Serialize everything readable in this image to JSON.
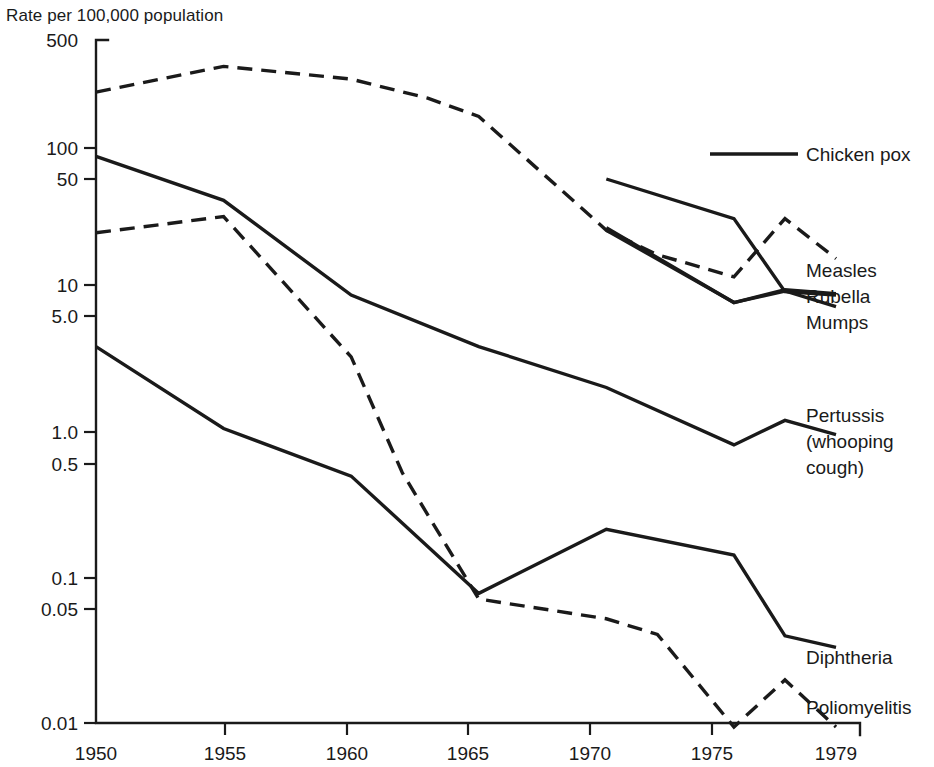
{
  "chart_data": {
    "type": "line",
    "title": "Rate per 100,000 population",
    "xlabel": "",
    "ylabel": "Rate per 100,000 population",
    "scale": "log",
    "grid": false,
    "legend_position": "right-inline-labels",
    "x": [
      1950,
      1955,
      1960,
      1965,
      1970,
      1975,
      1977,
      1979
    ],
    "xticks": [
      "1950",
      "1955",
      "1960",
      "1965",
      "1970",
      "1975",
      "1979"
    ],
    "xtick_values": [
      1950,
      1955,
      1960,
      1965,
      1970,
      1975,
      1979
    ],
    "yticks": [
      "500",
      "100",
      "50",
      "10",
      "5.0",
      "1.0",
      "0.5",
      "0.1",
      "0.05",
      "0.01"
    ],
    "ytick_values": [
      500,
      100,
      50,
      10,
      5.0,
      1.0,
      0.5,
      0.1,
      0.05,
      0.01
    ],
    "ylim": [
      0.01,
      500
    ],
    "xlim": [
      1950,
      1979
    ],
    "series": [
      {
        "name": "Measles",
        "label": "Measles",
        "style": "dashed",
        "x": [
          1950,
          1955,
          1960,
          1963,
          1965,
          1970,
          1972,
          1975,
          1977,
          1979
        ],
        "values": [
          220,
          330,
          270,
          200,
          150,
          25,
          17,
          12,
          30,
          16
        ]
      },
      {
        "name": "Chicken pox",
        "label": "Chicken pox",
        "style": "solid",
        "x": [
          1970,
          1975,
          1977,
          1979
        ],
        "values": [
          56,
          30,
          9.5,
          9.0
        ]
      },
      {
        "name": "Rubella",
        "label": "Rubella",
        "style": "solid",
        "x": [
          1970,
          1975,
          1977,
          1979
        ],
        "values": [
          26,
          8.0,
          9.8,
          9.2
        ]
      },
      {
        "name": "Mumps",
        "label": "Mumps",
        "style": "solid",
        "x": [
          1970,
          1975,
          1977,
          1979
        ],
        "values": [
          25,
          8.0,
          9.6,
          7.5
        ]
      },
      {
        "name": "Pertussis (whooping cough)",
        "label": "Pertussis\n(whooping\ncough)",
        "label_lines": [
          "Pertussis",
          "(whooping",
          "cough)"
        ],
        "style": "solid",
        "x": [
          1950,
          1955,
          1960,
          1965,
          1970,
          1975,
          1977,
          1979
        ],
        "values": [
          80,
          40,
          9.0,
          4.0,
          2.1,
          0.85,
          1.25,
          1.0
        ]
      },
      {
        "name": "Poliomyelitis",
        "label": "Poliomyelitis",
        "style": "dashed",
        "x": [
          1950,
          1955,
          1960,
          1962,
          1965,
          1970,
          1972,
          1975,
          1977,
          1979
        ],
        "values": [
          24,
          31,
          3.4,
          0.55,
          0.075,
          0.055,
          0.043,
          0.01,
          0.021,
          0.01
        ]
      },
      {
        "name": "Diphtheria",
        "label": "Diphtheria",
        "style": "solid",
        "x": [
          1950,
          1955,
          1960,
          1965,
          1970,
          1975,
          1977,
          1979
        ],
        "values": [
          4.0,
          1.1,
          0.52,
          0.082,
          0.225,
          0.15,
          0.042,
          0.035
        ]
      }
    ]
  },
  "axis": {
    "title": "Rate per 100,000 population"
  },
  "labels": {
    "chicken_pox": "Chicken pox",
    "measles": "Measles",
    "rubella": "Rubella",
    "mumps": "Mumps",
    "pertussis_1": "Pertussis",
    "pertussis_2": "(whooping",
    "pertussis_3": "cough)",
    "diphtheria": "Diphtheria",
    "poliomyelitis": "Poliomyelitis"
  },
  "colors": {
    "ink": "#1a1a1a",
    "background": "#ffffff"
  }
}
